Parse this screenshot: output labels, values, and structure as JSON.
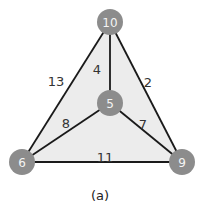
{
  "diagram": {
    "type": "weighted-graph",
    "colors": {
      "fill": "#ececec",
      "edge": "#1a1a1a",
      "node": "#8c8c8c",
      "node_text": "#f4f4f4"
    },
    "nodes": [
      {
        "id": "top",
        "label": "10",
        "x": 110,
        "y": 22
      },
      {
        "id": "center",
        "label": "5",
        "x": 110,
        "y": 103
      },
      {
        "id": "left",
        "label": "6",
        "x": 22,
        "y": 162
      },
      {
        "id": "right",
        "label": "9",
        "x": 182,
        "y": 162
      }
    ],
    "edges": [
      {
        "from": "top",
        "to": "left",
        "weight": "13",
        "lx": 56,
        "ly": 82
      },
      {
        "from": "top",
        "to": "center",
        "weight": "4",
        "lx": 97,
        "ly": 70
      },
      {
        "from": "top",
        "to": "right",
        "weight": "2",
        "lx": 148,
        "ly": 83
      },
      {
        "from": "center",
        "to": "left",
        "weight": "8",
        "lx": 66,
        "ly": 124
      },
      {
        "from": "center",
        "to": "right",
        "weight": "7",
        "lx": 143,
        "ly": 125
      },
      {
        "from": "left",
        "to": "right",
        "weight": "11",
        "lx": 105,
        "ly": 158
      }
    ],
    "caption": "(a)"
  }
}
